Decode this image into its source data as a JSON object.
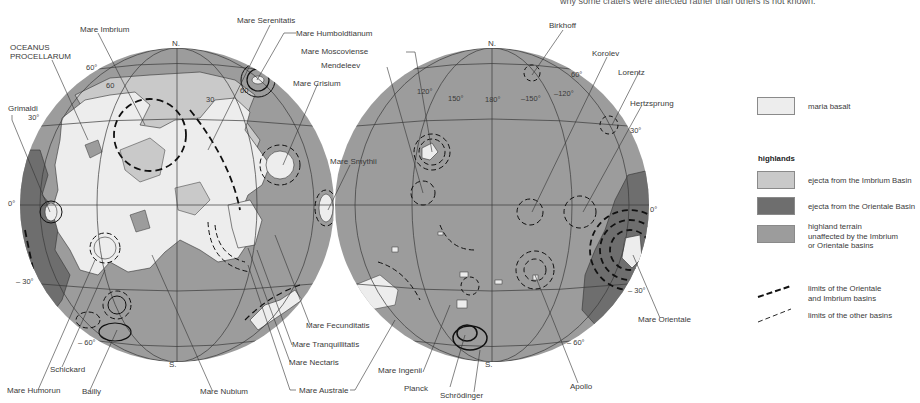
{
  "caption": "why some craters were affected rather than others is not known.",
  "colors": {
    "maria_basalt": "#ededed",
    "imbrium_ejecta": "#c9c9c9",
    "orientale_ejecta": "#6e6e6e",
    "highland": "#9c9c9c",
    "grid": "#3a3a3a",
    "basin_line": "#111111"
  },
  "near_side": {
    "pole_north": "N.",
    "pole_south": "S.",
    "degree_labels": [
      "60°",
      "30°",
      "0°",
      "– 30°",
      "– 60°",
      "60",
      "30",
      "60"
    ],
    "feature_labels": {
      "oceanus": [
        "OCEANUS",
        "PROCELLARUM"
      ],
      "mare_imbrium": "Mare Imbrium",
      "mare_serenitatis": "Mare Serenitatis",
      "mare_humboldtianum": "Mare Humboldtianum",
      "mare_crisium": "Mare Crisium",
      "mare_smythii": "Mare Smythii",
      "grimaldi": "Grimaldi",
      "mare_fecunditatis": "Mare Fecunditatis",
      "mare_tranquillitatis": "Mare Tranquillitatis",
      "mare_nectaris": "Mare Nectaris",
      "mare_australe": "Mare Australe",
      "mare_nubium": "Mare Nubium",
      "schickard": "Schickard",
      "mare_humorun": "Mare Humorun",
      "bailly": "Bailly"
    }
  },
  "far_side": {
    "pole_north": "N.",
    "pole_south": "S.",
    "degree_labels": [
      "120°",
      "150°",
      "180°",
      "–150°",
      "–120°",
      "60°",
      "30°",
      "0°",
      "– 30°",
      "– 60°"
    ],
    "feature_labels": {
      "birkhoff": "Birkhoff",
      "korolev": "Korolev",
      "lorentz": "Lorentz",
      "hertzsprung": "Hertzsprung",
      "mare_moscoviense": "Mare Moscoviense",
      "mendeleev": "Mendeleev",
      "mare_orientale": "Mare Orientale",
      "apollo": "Apollo",
      "mare_ingenii": "Mare Ingenii",
      "planck": "Planck",
      "schrodinger": "Schrödinger"
    }
  },
  "legend": {
    "maria_label": "maria basalt",
    "highlands_heading": "highlands",
    "items": [
      {
        "label": "ejecta from the Imbrium Basin"
      },
      {
        "label": "ejecta from the Orientale Basin"
      },
      {
        "label_lines": [
          "highland terrain",
          "unaffected by the Imbrium",
          "or Orientale basins"
        ]
      }
    ],
    "lines": [
      {
        "label_lines": [
          "limits of the Orientale",
          "and Imbrium basins"
        ]
      },
      {
        "label": "limits of the other basins"
      }
    ]
  }
}
